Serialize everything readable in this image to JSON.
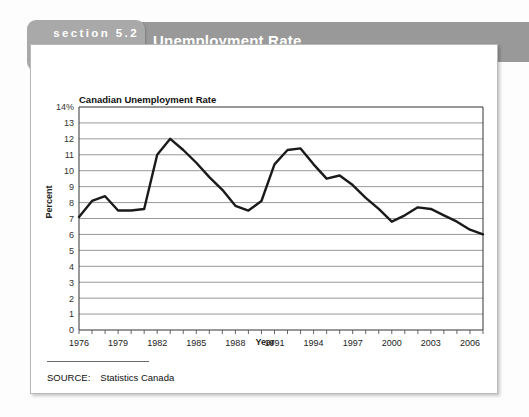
{
  "header": {
    "tab_section": "section 5.2",
    "tab_exhibit": "Exhibit 2",
    "title": "Unemployment Rate",
    "band_color": "#999999",
    "tab_color": "#a9a9a9"
  },
  "source": {
    "label": "SOURCE:",
    "value": "Statistics Canada"
  },
  "chart_data": {
    "type": "line",
    "title": "Canadian Unemployment Rate",
    "xlabel": "Year",
    "ylabel": "Percent",
    "grid": true,
    "legend": null,
    "line_color": "#1a1a1a",
    "ylim": [
      0,
      14
    ],
    "ytick_labels": [
      "14%",
      "13",
      "12",
      "11",
      "10",
      "9",
      "8",
      "7",
      "6",
      "5",
      "4",
      "3",
      "2",
      "1",
      "0"
    ],
    "yticks": [
      14,
      13,
      12,
      11,
      10,
      9,
      8,
      7,
      6,
      5,
      4,
      3,
      2,
      1,
      0
    ],
    "xlim": [
      1976,
      2007
    ],
    "xtick_labels": [
      "1976",
      "1979",
      "1982",
      "1985",
      "1988",
      "1991",
      "1994",
      "1997",
      "2000",
      "2003",
      "2006"
    ],
    "xticks": [
      1976,
      1979,
      1982,
      1985,
      1988,
      1991,
      1994,
      1997,
      2000,
      2003,
      2006
    ],
    "x": [
      1976,
      1977,
      1978,
      1979,
      1980,
      1981,
      1982,
      1983,
      1984,
      1985,
      1986,
      1987,
      1988,
      1989,
      1990,
      1991,
      1992,
      1993,
      1994,
      1995,
      1996,
      1997,
      1998,
      1999,
      2000,
      2001,
      2002,
      2003,
      2004,
      2005,
      2006,
      2007
    ],
    "values": [
      7.1,
      8.1,
      8.4,
      7.5,
      7.5,
      7.6,
      11.0,
      12.0,
      11.3,
      10.5,
      9.6,
      8.8,
      7.8,
      7.5,
      8.1,
      10.4,
      11.3,
      11.4,
      10.4,
      9.5,
      9.7,
      9.1,
      8.3,
      7.6,
      6.8,
      7.2,
      7.7,
      7.6,
      7.2,
      6.8,
      6.3,
      6.0
    ]
  }
}
